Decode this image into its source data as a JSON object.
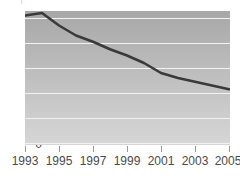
{
  "chart_data": {
    "type": "line",
    "title": "",
    "xlabel": "",
    "ylabel": "",
    "xlim": [
      1993,
      2005
    ],
    "ylim": [
      0,
      55
    ],
    "grid": true,
    "legend": null,
    "y_ticks": [
      0,
      10,
      20,
      30,
      40,
      50
    ],
    "x_ticks": [
      1993,
      1995,
      1997,
      1999,
      2001,
      2003,
      2005
    ],
    "x": [
      1993,
      1994,
      1995,
      1996,
      1997,
      1998,
      1999,
      2000,
      2001,
      2002,
      2003,
      2004,
      2005
    ],
    "series": [
      {
        "name": "value",
        "values": [
          51,
          52,
          47,
          43,
          40.5,
          37.5,
          35,
          32,
          28,
          26,
          24.5,
          23,
          21.5
        ],
        "color": "#3a3a3a"
      }
    ]
  },
  "axes": {
    "y_tick_labels": [
      "50",
      "40",
      "30",
      "20",
      "10",
      "0"
    ],
    "x_tick_labels": [
      "1993",
      "1995",
      "1997",
      "1999",
      "2001",
      "2003",
      "2005"
    ]
  },
  "style": {
    "line_color": "#3a3a3a",
    "gridline_color": "#f2f2f2",
    "tick_color": "#9a9a9a",
    "label_color": "#4a4a4a",
    "plot_bg_top": "#a8a8a8",
    "plot_bg_bottom": "#d6d6d6"
  },
  "cropped_title": {
    "text": "·  ·  |  ·  ·  ·  ·  ·  ·  ·"
  }
}
